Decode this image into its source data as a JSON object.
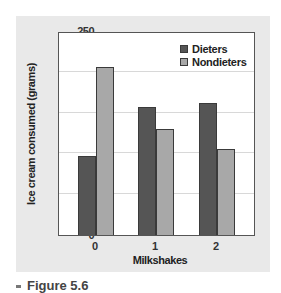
{
  "chart_data": {
    "type": "bar",
    "title": "",
    "xlabel": "Milkshakes",
    "ylabel": "Ice cream consumed (grams)",
    "categories": [
      "0",
      "1",
      "2"
    ],
    "series": [
      {
        "name": "Dieters",
        "color": "#555555",
        "values": [
          97,
          157,
          162
        ]
      },
      {
        "name": "Nondieters",
        "color": "#a8a8a8",
        "values": [
          206,
          130,
          106
        ]
      }
    ],
    "ylim": [
      0,
      250
    ],
    "yticks": [
      0,
      50,
      100,
      150,
      200,
      250
    ],
    "grid": true,
    "legend_position": "upper right"
  },
  "caption": "Figure 5.6"
}
